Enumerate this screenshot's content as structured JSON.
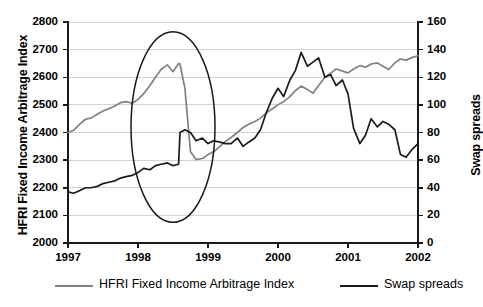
{
  "chart_data": {
    "type": "line",
    "title": "",
    "xlabel": "",
    "grid": true,
    "legend_position": "bottom",
    "x_axis": {
      "ticks": [
        "1997",
        "1998",
        "1999",
        "2000",
        "2001",
        "2002"
      ],
      "xlim": [
        1997,
        2002
      ]
    },
    "y_axis_left": {
      "label": "HFRI Fixed Income Arbitrage Index",
      "ticks": [
        "2000",
        "2100",
        "2200",
        "2300",
        "2400",
        "2500",
        "2600",
        "2700",
        "2800"
      ],
      "ylim": [
        2000,
        2800
      ],
      "color": "#808080"
    },
    "y_axis_right": {
      "label": "Swap spreads",
      "ticks": [
        "0",
        "20",
        "40",
        "60",
        "80",
        "100",
        "120",
        "140",
        "160"
      ],
      "ylim": [
        0,
        160
      ],
      "color": "#000000"
    },
    "series": [
      {
        "name": "HFRI Fixed Income Arbitrage Index",
        "axis": "left",
        "color": "#808080",
        "x": [
          1997.0,
          1997.08,
          1997.17,
          1997.25,
          1997.33,
          1997.42,
          1997.5,
          1997.58,
          1997.67,
          1997.75,
          1997.83,
          1997.92,
          1998.0,
          1998.08,
          1998.17,
          1998.25,
          1998.33,
          1998.42,
          1998.5,
          1998.58,
          1998.6,
          1998.67,
          1998.75,
          1998.83,
          1998.92,
          1999.0,
          1999.08,
          1999.17,
          1999.25,
          1999.33,
          1999.42,
          1999.5,
          1999.58,
          1999.67,
          1999.75,
          1999.83,
          1999.92,
          2000.0,
          2000.08,
          2000.17,
          2000.25,
          2000.33,
          2000.42,
          2000.5,
          2000.58,
          2000.67,
          2000.75,
          2000.83,
          2000.92,
          2001.0,
          2001.08,
          2001.17,
          2001.25,
          2001.33,
          2001.42,
          2001.5,
          2001.58,
          2001.67,
          2001.75,
          2001.83,
          2001.92,
          2002.0
        ],
        "values": [
          2400,
          2408,
          2430,
          2448,
          2452,
          2466,
          2478,
          2486,
          2496,
          2508,
          2512,
          2506,
          2520,
          2540,
          2570,
          2600,
          2628,
          2645,
          2620,
          2650,
          2648,
          2560,
          2330,
          2302,
          2306,
          2320,
          2330,
          2350,
          2368,
          2382,
          2400,
          2418,
          2430,
          2440,
          2452,
          2470,
          2486,
          2500,
          2512,
          2530,
          2552,
          2568,
          2556,
          2542,
          2570,
          2600,
          2614,
          2630,
          2622,
          2616,
          2630,
          2642,
          2636,
          2648,
          2652,
          2640,
          2628,
          2652,
          2666,
          2662,
          2672,
          2678
        ]
      },
      {
        "name": "Swap spreads",
        "axis": "right",
        "color": "#1a1a1a",
        "x": [
          1997.0,
          1997.08,
          1997.17,
          1997.25,
          1997.33,
          1997.42,
          1997.5,
          1997.58,
          1997.67,
          1997.75,
          1997.83,
          1997.92,
          1998.0,
          1998.08,
          1998.17,
          1998.25,
          1998.33,
          1998.42,
          1998.5,
          1998.58,
          1998.6,
          1998.67,
          1998.75,
          1998.83,
          1998.92,
          1999.0,
          1999.08,
          1999.17,
          1999.25,
          1999.33,
          1999.42,
          1999.5,
          1999.58,
          1999.67,
          1999.75,
          1999.83,
          1999.92,
          2000.0,
          2000.08,
          2000.17,
          2000.25,
          2000.33,
          2000.42,
          2000.5,
          2000.58,
          2000.67,
          2000.75,
          2000.83,
          2000.92,
          2001.0,
          2001.08,
          2001.17,
          2001.25,
          2001.33,
          2001.42,
          2001.5,
          2001.58,
          2001.67,
          2001.75,
          2001.83,
          2001.92,
          2002.0
        ],
        "values": [
          37,
          36,
          38,
          40,
          40,
          41,
          43,
          44,
          45,
          47,
          48,
          49,
          51,
          54,
          53,
          56,
          57,
          58,
          56,
          57,
          80,
          82,
          80,
          74,
          76,
          72,
          74,
          73,
          72,
          72,
          76,
          70,
          73,
          76,
          82,
          94,
          105,
          112,
          106,
          118,
          125,
          138,
          128,
          131,
          134,
          120,
          122,
          114,
          118,
          108,
          83,
          72,
          78,
          90,
          84,
          88,
          86,
          82,
          64,
          62,
          68,
          72
        ]
      }
    ],
    "annotations": [
      {
        "type": "ellipse",
        "name": "ltcm-crisis-highlight",
        "cx_year": 1998.5,
        "cy_left_value": 2420,
        "rx_years": 0.6,
        "ry_left_value": 345
      }
    ]
  },
  "legend": {
    "items": [
      {
        "label": "HFRI Fixed Income Arbitrage Index",
        "color": "#808080",
        "left": 55
      },
      {
        "label": "Swap spreads",
        "color": "#1a1a1a",
        "left": 340
      }
    ]
  }
}
